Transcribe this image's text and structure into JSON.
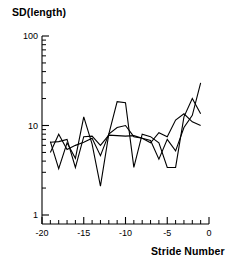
{
  "figure": {
    "y_axis_title": "SD(length)",
    "x_axis_title": "Stride Number"
  },
  "chart_data": {
    "type": "line",
    "title": "",
    "subtitle": "",
    "xlabel": "Stride Number",
    "ylabel": "SD(length)",
    "xscale": "linear",
    "yscale": "log",
    "xlim": [
      -20,
      0
    ],
    "ylim": [
      1,
      100
    ],
    "grid": false,
    "legend": "none",
    "x_ticks_major": [
      -20,
      -15,
      -10,
      -5,
      0
    ],
    "x_tick_labels": [
      "-20",
      "-15",
      "-10",
      "-5",
      "0"
    ],
    "x_ticks_minor": [
      -19,
      -18,
      -17,
      -16,
      -14,
      -13,
      -12,
      -11,
      -9,
      -8,
      -7,
      -6,
      -4,
      -3,
      -2,
      -1
    ],
    "y_ticks_major": [
      1,
      10,
      100
    ],
    "y_tick_labels": [
      "1",
      "10",
      "100"
    ],
    "y_ticks_minor": [
      2,
      3,
      4,
      5,
      6,
      7,
      8,
      9,
      20,
      30,
      40,
      50,
      60,
      70,
      80,
      90
    ],
    "x": [
      -19,
      -18,
      -17,
      -16,
      -15,
      -14,
      -13,
      -12,
      -11,
      -10,
      -9,
      -8,
      -7,
      -6,
      -5,
      -4,
      -3,
      -2,
      -1
    ],
    "series": [
      {
        "name": "trace-1",
        "color": "#000000",
        "x": [
          -19,
          -18,
          -17,
          -16,
          -15,
          -14,
          -13,
          -12,
          -11,
          -10,
          -9,
          -8,
          -7,
          -6,
          -5,
          -4,
          -3,
          -2,
          -1
        ],
        "values": [
          5.0,
          8.0,
          5.4,
          6.0,
          6.5,
          7.2,
          4.6,
          8.0,
          9.5,
          10.0,
          7.5,
          7.2,
          6.8,
          4.2,
          7.0,
          5.2,
          9.5,
          13.0,
          30.0
        ]
      },
      {
        "name": "trace-2",
        "color": "#000000",
        "x": [
          -19,
          -18,
          -17,
          -16,
          -15,
          -14,
          -13,
          -12,
          -11,
          -10,
          -9,
          -8,
          -7,
          -6,
          -5,
          -4,
          -3,
          -2,
          -1
        ],
        "values": [
          6.6,
          3.3,
          6.4,
          4.3,
          12.5,
          6.2,
          2.1,
          8.0,
          18.5,
          18.0,
          3.4,
          8.0,
          7.5,
          6.4,
          3.4,
          3.4,
          12.5,
          20.0,
          13.5
        ]
      },
      {
        "name": "trace-3",
        "color": "#000000",
        "x": [
          -19,
          -18,
          -17,
          -16,
          -15,
          -14,
          -13,
          -12,
          -11,
          -10,
          -9,
          -8,
          -7,
          -6,
          -5,
          -4,
          -3,
          -2,
          -1
        ],
        "values": [
          6.5,
          6.6,
          7.0,
          3.4,
          7.5,
          7.6,
          6.0,
          7.8,
          7.7,
          7.6,
          7.7,
          7.2,
          6.4,
          8.3,
          7.5,
          11.5,
          13.5,
          11.0,
          10.0
        ]
      }
    ],
    "annotations": []
  }
}
